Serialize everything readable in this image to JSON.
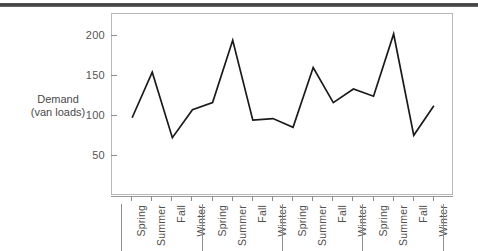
{
  "figure": {
    "top_rule_color": "#4a4a4a",
    "line_color": "#1a1a1a",
    "frame_color": "#b9b9b9",
    "background": "#ffffff"
  },
  "axis": {
    "y_title_line1": "Demand",
    "y_title_line2": "(van loads)",
    "y_ticks": [
      50,
      100,
      150,
      200
    ],
    "y_tick_labels": [
      "50",
      "100",
      "150",
      "200"
    ]
  },
  "chart_data": {
    "type": "line",
    "title": "",
    "xlabel": "",
    "ylabel": "Demand (van loads)",
    "ylim": [
      0,
      228
    ],
    "xlim": [
      0,
      17
    ],
    "grid": false,
    "legend": false,
    "marker": "none",
    "categories": [
      "Spring",
      "Summer",
      "Fall",
      "Winter",
      "Spring",
      "Summer",
      "Fall",
      "Winter",
      "Spring",
      "Summer",
      "Fall",
      "Winter",
      "Spring",
      "Summer",
      "Fall",
      "Winter"
    ],
    "group_separators_after_index": [
      3,
      7,
      11
    ],
    "values": [
      98,
      155,
      73,
      108,
      117,
      195,
      95,
      97,
      86,
      161,
      117,
      134,
      125,
      203,
      76,
      113
    ],
    "series": [
      {
        "name": "Demand",
        "values": [
          98,
          155,
          73,
          108,
          117,
          195,
          95,
          97,
          86,
          161,
          117,
          134,
          125,
          203,
          76,
          113
        ]
      }
    ]
  }
}
